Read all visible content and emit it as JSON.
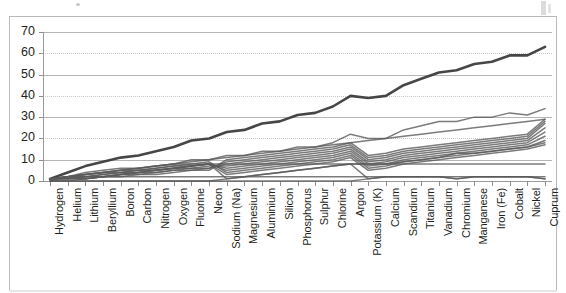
{
  "chart_data": {
    "type": "line",
    "title": "",
    "subtitle": "",
    "xlabel": "",
    "ylabel": "",
    "ylim": [
      0,
      70
    ],
    "ytick_labels": [
      "70",
      "60",
      "50",
      "40",
      "30",
      "20",
      "10",
      "0"
    ],
    "ytick_values": [
      70,
      60,
      50,
      40,
      30,
      20,
      10,
      0
    ],
    "grid": true,
    "legend": "none",
    "categories": [
      "Hydrogen",
      "Helium",
      "Lithium",
      "Beryllium",
      "Boron",
      "Carbon",
      "Nitrogen",
      "Oxygen",
      "Fluorine",
      "Neon",
      "Sodium (Na)",
      "Magnesium",
      "Aluminium",
      "Silicon",
      "Phosphorus",
      "Sulphur",
      "Chlorine",
      "Argon",
      "Potassium (K)",
      "Calcium",
      "Scandium",
      "Titanium",
      "Vanadium",
      "Chromium",
      "Manganese",
      "Iron (Fe)",
      "Cobalt",
      "Nickel",
      "Cuprum"
    ],
    "series": [
      {
        "name": "Atomic mass",
        "values": [
          1,
          4,
          7,
          9,
          11,
          12,
          14,
          16,
          19,
          20,
          23,
          24,
          27,
          28,
          31,
          32,
          35,
          40,
          39,
          40,
          45,
          48,
          51,
          52,
          55,
          56,
          59,
          59,
          63
        ]
      },
      {
        "name": "Atomic number",
        "values": [
          1,
          2,
          3,
          4,
          5,
          6,
          7,
          8,
          9,
          10,
          11,
          12,
          13,
          14,
          15,
          16,
          17,
          18,
          19,
          20,
          21,
          22,
          23,
          24,
          25,
          26,
          27,
          28,
          29
        ]
      },
      {
        "name": "Neutrons",
        "values": [
          0,
          2,
          4,
          5,
          6,
          6,
          7,
          8,
          10,
          10,
          12,
          12,
          14,
          14,
          16,
          16,
          18,
          22,
          20,
          20,
          24,
          26,
          28,
          28,
          30,
          30,
          32,
          31,
          34
        ]
      },
      {
        "name": "Shell electrons outer",
        "values": [
          1,
          2,
          1,
          2,
          3,
          4,
          5,
          6,
          7,
          8,
          1,
          2,
          3,
          4,
          5,
          6,
          7,
          8,
          1,
          2,
          2,
          2,
          2,
          1,
          2,
          2,
          2,
          2,
          1
        ]
      },
      {
        "name": "Period fill 1",
        "values": [
          1,
          2,
          2,
          2,
          2,
          2,
          2,
          2,
          2,
          2,
          2,
          2,
          2,
          2,
          2,
          2,
          2,
          2,
          2,
          2,
          2,
          2,
          2,
          2,
          2,
          2,
          2,
          2,
          2
        ]
      },
      {
        "name": "Period fill 2",
        "values": [
          0,
          0,
          1,
          2,
          3,
          4,
          5,
          6,
          7,
          8,
          8,
          8,
          8,
          8,
          8,
          8,
          8,
          8,
          8,
          8,
          8,
          8,
          8,
          8,
          8,
          8,
          8,
          8,
          8
        ]
      },
      {
        "name": "Period fill 3",
        "values": [
          0,
          0,
          0,
          0,
          0,
          0,
          0,
          0,
          0,
          0,
          1,
          2,
          3,
          4,
          5,
          6,
          7,
          8,
          8,
          8,
          9,
          10,
          11,
          13,
          13,
          14,
          15,
          16,
          18
        ]
      },
      {
        "name": "Period fill 4",
        "values": [
          0,
          0,
          0,
          0,
          0,
          0,
          0,
          0,
          0,
          0,
          0,
          0,
          0,
          0,
          0,
          0,
          0,
          0,
          1,
          2,
          2,
          2,
          2,
          1,
          2,
          2,
          2,
          2,
          1
        ]
      },
      {
        "name": "Band a",
        "values": [
          1,
          2,
          3,
          4,
          5,
          6,
          7,
          8,
          8,
          8,
          3,
          4,
          5,
          6,
          7,
          8,
          9,
          11,
          5,
          6,
          8,
          9,
          10,
          11,
          12,
          13,
          14,
          15,
          17
        ]
      },
      {
        "name": "Band b",
        "values": [
          1,
          2,
          3,
          4,
          5,
          5,
          6,
          7,
          8,
          9,
          4,
          5,
          6,
          7,
          8,
          9,
          10,
          12,
          6,
          7,
          9,
          10,
          11,
          12,
          13,
          14,
          15,
          16,
          19
        ]
      },
      {
        "name": "Band c",
        "values": [
          1,
          2,
          3,
          4,
          4,
          5,
          6,
          7,
          7,
          8,
          5,
          6,
          7,
          8,
          9,
          10,
          11,
          13,
          7,
          8,
          10,
          11,
          12,
          13,
          14,
          15,
          16,
          17,
          21
        ]
      },
      {
        "name": "Band d",
        "values": [
          1,
          2,
          2,
          3,
          4,
          5,
          5,
          6,
          7,
          8,
          6,
          7,
          8,
          9,
          10,
          11,
          12,
          14,
          8,
          9,
          11,
          12,
          13,
          14,
          15,
          16,
          17,
          18,
          23
        ]
      },
      {
        "name": "Band e",
        "values": [
          1,
          1,
          2,
          3,
          4,
          4,
          5,
          6,
          6,
          7,
          7,
          8,
          9,
          10,
          11,
          12,
          13,
          15,
          9,
          10,
          12,
          13,
          14,
          15,
          16,
          17,
          18,
          19,
          25
        ]
      },
      {
        "name": "Band f",
        "values": [
          1,
          1,
          2,
          2,
          3,
          4,
          4,
          5,
          6,
          6,
          8,
          9,
          10,
          11,
          12,
          13,
          14,
          16,
          10,
          11,
          13,
          14,
          15,
          16,
          17,
          18,
          19,
          20,
          27
        ]
      },
      {
        "name": "Band g",
        "values": [
          1,
          1,
          1,
          2,
          3,
          3,
          4,
          5,
          5,
          6,
          9,
          10,
          11,
          12,
          13,
          14,
          15,
          17,
          11,
          12,
          14,
          15,
          16,
          17,
          18,
          19,
          20,
          21,
          28
        ]
      },
      {
        "name": "Band h",
        "values": [
          1,
          1,
          1,
          2,
          2,
          3,
          3,
          4,
          5,
          5,
          10,
          11,
          12,
          13,
          14,
          15,
          16,
          18,
          12,
          13,
          15,
          16,
          17,
          18,
          19,
          20,
          21,
          22,
          29
        ]
      }
    ]
  },
  "colors": {
    "top_line": "#3c3c3c",
    "band_line": "#5a5a5a",
    "gridline": "#b5b5b7",
    "axis": "#9a9a9c",
    "frame": "#b9b9bb",
    "background": "#ffffff",
    "text": "#231f20"
  }
}
